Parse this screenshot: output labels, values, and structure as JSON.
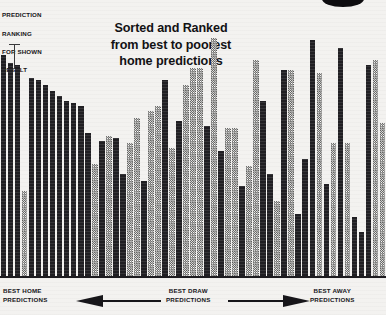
{
  "axis_caption": {
    "lines": [
      "PREDICTION",
      "RANKING",
      "FOR SHOWN",
      "RESULT"
    ]
  },
  "title": {
    "line1": "Sorted and Ranked",
    "line2": "from best to poorest",
    "line3": "home predictions"
  },
  "footer": {
    "home": {
      "line1": "BEST HOME",
      "line2": "PREDICTIONS"
    },
    "draw": {
      "line1": "BEST DRAW",
      "line2": "PREDICTIONS"
    },
    "away": {
      "line1": "BEST AWAY",
      "line2": "PREDICTIONS"
    },
    "left_arrow": "left-arrow-icon",
    "right_arrow": "right-arrow-icon"
  },
  "colors": {
    "dark_bar": "#201f23",
    "light_bar": "#a9a8a6",
    "background": "#f3f2f0",
    "text": "#17161a"
  },
  "chart_data": {
    "type": "bar",
    "title": "Sorted and Ranked from best to poorest home predictions",
    "xlabel": "",
    "ylabel": "PREDICTION RANKING FOR SHOWN RESULT",
    "ylim": [
      0,
      100
    ],
    "grid": false,
    "legend_position": "none",
    "x_axis_annotations": [
      "BEST HOME PREDICTIONS",
      "BEST DRAW PREDICTIONS",
      "BEST AWAY PREDICTIONS"
    ],
    "note": "Each bar is one ranked match; bars alternate between dark (solid) and light (hatched) fill patterns.",
    "categories": [
      "1",
      "2",
      "3",
      "4",
      "5",
      "6",
      "7",
      "8",
      "9",
      "10",
      "11",
      "12",
      "13",
      "14",
      "15",
      "16",
      "17",
      "18",
      "19",
      "20",
      "21",
      "22",
      "23",
      "24",
      "25",
      "26",
      "27",
      "28",
      "29",
      "30",
      "31",
      "32",
      "33",
      "34",
      "35",
      "36",
      "37",
      "38",
      "39",
      "40",
      "41",
      "42",
      "43",
      "44",
      "45",
      "46",
      "47",
      "48",
      "49",
      "50",
      "51",
      "52",
      "53",
      "54",
      "55"
    ],
    "values": [
      88,
      85,
      84,
      34,
      79,
      78,
      76,
      74,
      72,
      70,
      69,
      68,
      57,
      45,
      54,
      56,
      55,
      41,
      53,
      63,
      38,
      66,
      68,
      78,
      51,
      62,
      76,
      83,
      83,
      60,
      95,
      50,
      59,
      59,
      36,
      44,
      86,
      70,
      41,
      30,
      82,
      82,
      25,
      47,
      94,
      81,
      37,
      53,
      91,
      53,
      24,
      18,
      84,
      86,
      61
    ],
    "shades": [
      "dark",
      "dark",
      "dark",
      "light",
      "dark",
      "dark",
      "dark",
      "dark",
      "dark",
      "dark",
      "dark",
      "dark",
      "dark",
      "light",
      "dark",
      "light",
      "dark",
      "dark",
      "light",
      "light",
      "dark",
      "light",
      "light",
      "dark",
      "light",
      "dark",
      "light",
      "light",
      "light",
      "dark",
      "light",
      "dark",
      "light",
      "light",
      "dark",
      "light",
      "light",
      "dark",
      "dark",
      "light",
      "dark",
      "light",
      "dark",
      "dark",
      "dark",
      "light",
      "dark",
      "light",
      "dark",
      "light",
      "dark",
      "dark",
      "dark",
      "light",
      "light"
    ]
  }
}
